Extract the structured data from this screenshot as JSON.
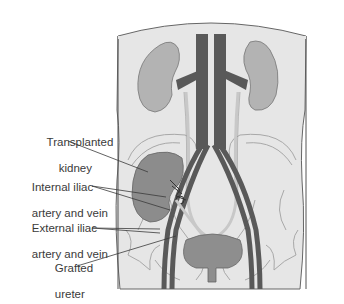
{
  "diagram": {
    "labels": [
      {
        "id": "transplanted-kidney",
        "line1": "Transplanted",
        "line2": "kidney"
      },
      {
        "id": "internal-iliac",
        "line1": "Internal iliac",
        "line2": "artery and vein"
      },
      {
        "id": "external-iliac",
        "line1": "External iliac",
        "line2": "artery and vein"
      },
      {
        "id": "grafted-ureter",
        "line1": "Grafted",
        "line2": "ureter"
      }
    ],
    "colors": {
      "background": "#ffffff",
      "body": "#e6e6e6",
      "body_outline": "#555555",
      "native_kidney": "#b3b3b3",
      "transplanted_kidney": "#8c8c8c",
      "vessels": "#595959",
      "ureter": "#c8c8c8",
      "bladder": "#8e8e8e",
      "bone_outline": "#a8a8a8",
      "leader_line": "#3a3a3a",
      "label_text": "#3a3a3a"
    }
  }
}
